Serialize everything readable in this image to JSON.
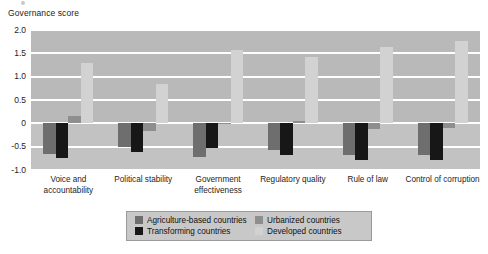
{
  "chart_data": {
    "type": "bar",
    "title": "",
    "ylabel": "Governance score",
    "xlabel": "",
    "ylim": [
      -1.0,
      2.0
    ],
    "yticks": [
      "2.0",
      "1.5",
      "1.0",
      "0.5",
      "0",
      "-0.5",
      "-1.0"
    ],
    "ytick_values": [
      2.0,
      1.5,
      1.0,
      0.5,
      0,
      -0.5,
      -1.0
    ],
    "grid": true,
    "legend_position": "bottom",
    "categories": [
      "Voice and accountability",
      "Political stability",
      "Government effectiveness",
      "Regulatory quality",
      "Rule of law",
      "Control of corruption"
    ],
    "series": [
      {
        "name": "Agriculture-based countries",
        "color": "#6e6e6e",
        "values": [
          -0.65,
          -0.5,
          -0.72,
          -0.58,
          -0.68,
          -0.68
        ]
      },
      {
        "name": "Transforming countries",
        "color": "#171717",
        "values": [
          -0.75,
          -0.62,
          -0.52,
          -0.68,
          -0.78,
          -0.78
        ]
      },
      {
        "name": "Urbanized countries",
        "color": "#8e8e8e",
        "values": [
          0.15,
          -0.17,
          -0.02,
          0.05,
          -0.12,
          -0.1
        ]
      },
      {
        "name": "Developed countries",
        "color": "#d2d2d2",
        "values": [
          1.3,
          0.85,
          1.58,
          1.42,
          1.63,
          1.76
        ]
      }
    ]
  },
  "legend": {
    "entries": [
      {
        "label": "Agriculture-based countries",
        "color": "#6e6e6e"
      },
      {
        "label": "Transforming countries",
        "color": "#171717"
      },
      {
        "label": "Urbanized countries",
        "color": "#8e8e8e"
      },
      {
        "label": "Developed countries",
        "color": "#d2d2d2"
      }
    ]
  },
  "colors": {
    "plot_background": "#b9b9b9",
    "plot_background_lower": "#c2c2c2",
    "gridline": "#ffffff",
    "legend_background": "#c8c8c8",
    "text": "#1d1d1d"
  }
}
